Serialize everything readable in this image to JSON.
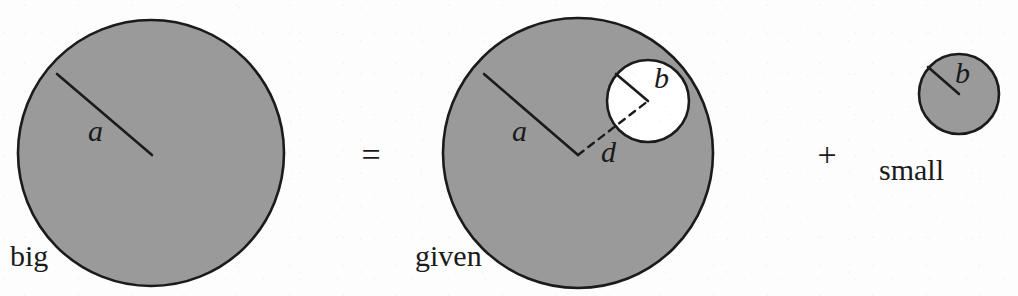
{
  "figure": {
    "caption_terms": [
      "big",
      "given",
      "small"
    ],
    "background_color": "#fdfdfd",
    "disc_fill_color": "#9a9a9a",
    "hole_fill_color": "#ffffff",
    "stroke_color": "#1b1b1b",
    "relation": "big = given + small"
  },
  "operators": [
    {
      "name": "equals",
      "symbol": "=",
      "x": 371,
      "y": 166
    },
    {
      "name": "plus",
      "symbol": "+",
      "x": 827,
      "y": 166
    }
  ],
  "shapes": {
    "big_circle": {
      "label": "big",
      "label_x": 10,
      "label_y": 266,
      "center_x": 151,
      "center_y": 153,
      "radius": 133,
      "fill": "#9a9a9a",
      "radius_marker": {
        "label": "a",
        "label_x": 88,
        "label_y": 141,
        "from_x": 57,
        "from_y": 74,
        "to_x": 152,
        "to_y": 155
      }
    },
    "given_circle": {
      "label": "given",
      "label_x": 415,
      "label_y": 266,
      "center_x": 578,
      "center_y": 153,
      "radius": 135,
      "fill": "#9a9a9a",
      "radius_marker": {
        "label": "a",
        "label_x": 512,
        "label_y": 141,
        "from_x": 484,
        "from_y": 74,
        "to_x": 578,
        "to_y": 155
      },
      "hole": {
        "label": "b",
        "label_x": 654,
        "label_y": 88,
        "center_x": 648,
        "center_y": 101,
        "radius": 41,
        "fill": "#ffffff",
        "radius_marker": {
          "from_x": 616,
          "from_y": 74,
          "to_x": 648,
          "to_y": 101
        }
      },
      "distance_marker": {
        "label": "d",
        "label_x": 601,
        "label_y": 162,
        "from_x": 578,
        "from_y": 155,
        "to_x": 648,
        "to_y": 101
      }
    },
    "small_circle": {
      "label": "small",
      "label_x": 879,
      "label_y": 180,
      "center_x": 959,
      "center_y": 94,
      "radius": 40,
      "fill": "#9a9a9a",
      "radius_marker": {
        "label": "b",
        "label_x": 955,
        "label_y": 83,
        "from_x": 928,
        "from_y": 67,
        "to_x": 959,
        "to_y": 94
      }
    }
  }
}
